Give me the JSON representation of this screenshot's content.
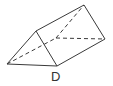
{
  "figure": {
    "shape": "triangular-prism",
    "label": "D",
    "stroke_color": "#3a3a3a",
    "vertices": {
      "front_left": [
        7,
        64
      ],
      "front_top": [
        36,
        31
      ],
      "front_bottom": [
        57,
        66
      ],
      "back_top": [
        84,
        5
      ],
      "back_right": [
        105,
        39
      ],
      "back_left_hidden": [
        56,
        38
      ]
    },
    "visible_edges": [
      [
        "front_left",
        "front_top"
      ],
      [
        "front_top",
        "front_bottom"
      ],
      [
        "front_left",
        "front_bottom"
      ],
      [
        "front_top",
        "back_top"
      ],
      [
        "back_top",
        "back_right"
      ],
      [
        "front_bottom",
        "back_right"
      ]
    ],
    "hidden_edges": [
      [
        "front_left",
        "back_left_hidden"
      ],
      [
        "back_left_hidden",
        "back_top"
      ],
      [
        "back_left_hidden",
        "back_right"
      ]
    ]
  }
}
